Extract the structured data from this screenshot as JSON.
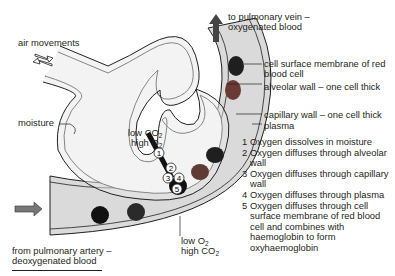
{
  "labels": {
    "air_movements": "air movements",
    "moisture": "moisture",
    "to_vein_line1": "to pulmonary vein –",
    "to_vein_line2": "oxygenated blood",
    "from_artery_line1": "from pulmonary artery –",
    "from_artery_line2": "deoxygenated blood",
    "cell_membrane_line1": "cell surface membrane of red",
    "cell_membrane_line2": "blood cell",
    "alveolar_wall": "alveolar wall – one cell thick",
    "capillary_wall": "capillary wall – one cell thick",
    "plasma": "plasma",
    "alveolus_gas": {
      "line1": "low CO",
      "line1_sub": "2",
      "line2": "high O",
      "line2_sub": "2"
    },
    "blood_gas": {
      "line1": "low O",
      "line1_sub": "2",
      "line2": "high CO",
      "line2_sub": "2"
    }
  },
  "markers": [
    "1",
    "2",
    "3",
    "4",
    "5"
  ],
  "steps": [
    {
      "n": "1",
      "text": "Oxygen dissolves in moisture"
    },
    {
      "n": "2",
      "text": "Oxygen diffuses through alveolar\nwall"
    },
    {
      "n": "3",
      "text": "Oxygen diffuses through capillary\nwall"
    },
    {
      "n": "4",
      "text": "Oxygen diffuses through plasma"
    },
    {
      "n": "5",
      "text": "Oxygen diffuses through cell\nsurface membrane of red blood\ncell and combines with\nhaemoglobin to form\noxyhaemoglobin"
    }
  ],
  "colors": {
    "capillary_fill": "#d9dad9",
    "wall_fill": "#e8e8e8",
    "outline": "#231f20",
    "rbc_dark": "#1f1f1f",
    "rbc_red": "#6a3a34",
    "arrow": "#555555"
  }
}
